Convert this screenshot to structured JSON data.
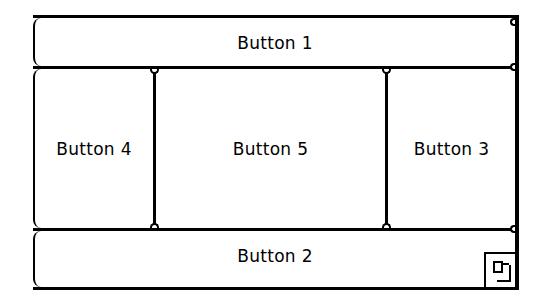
{
  "window": {
    "panes": {
      "top": {
        "label": "Button 1"
      },
      "bottom": {
        "label": "Button 2"
      },
      "right": {
        "label": "Button 3"
      },
      "left": {
        "label": "Button 4"
      },
      "center": {
        "label": "Button 5"
      }
    },
    "grow_box": {
      "icon": "resize-grip-icon"
    }
  },
  "colors": {
    "border": "#000000",
    "background": "#ffffff"
  }
}
